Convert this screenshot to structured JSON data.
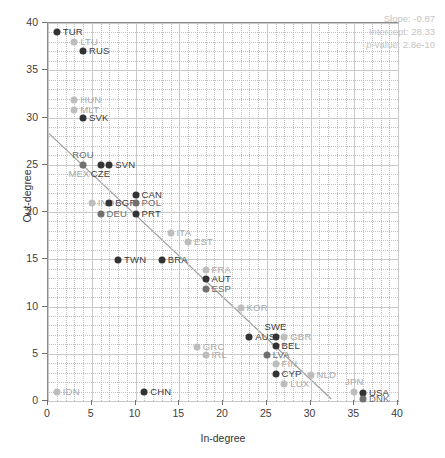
{
  "chart_data": {
    "type": "scatter",
    "title": "",
    "xlabel": "In-degree",
    "ylabel": "Out-degree",
    "xlim": [
      0,
      40
    ],
    "ylim": [
      0,
      40
    ],
    "xticks": [
      0,
      5,
      10,
      15,
      20,
      25,
      30,
      35,
      40
    ],
    "yticks": [
      0,
      5,
      10,
      15,
      20,
      25,
      30,
      35,
      40
    ],
    "grid": true,
    "legend": "none",
    "points": [
      {
        "label": "TUR",
        "x": 1,
        "y": 39,
        "shade": "dark",
        "pos": "right"
      },
      {
        "label": "LTU",
        "x": 3,
        "y": 38,
        "shade": "light",
        "pos": "right"
      },
      {
        "label": "RUS",
        "x": 4,
        "y": 37,
        "shade": "dark",
        "pos": "right"
      },
      {
        "label": "HUN",
        "x": 3,
        "y": 31.9,
        "shade": "light",
        "pos": "right"
      },
      {
        "label": "MLT",
        "x": 3,
        "y": 30.8,
        "shade": "light",
        "pos": "right"
      },
      {
        "label": "SVK",
        "x": 4,
        "y": 29.9,
        "shade": "dark",
        "pos": "right"
      },
      {
        "label": "MEX",
        "x": 4,
        "y": 25,
        "shade": "light",
        "pos": "below-left"
      },
      {
        "label": "ROU",
        "x": 4,
        "y": 25,
        "shade": "mid",
        "pos": "above"
      },
      {
        "label": "CZE",
        "x": 6,
        "y": 25,
        "shade": "dark",
        "pos": "below"
      },
      {
        "label": "SVN",
        "x": 7,
        "y": 25,
        "shade": "dark",
        "pos": "right"
      },
      {
        "label": "CAN",
        "x": 10,
        "y": 21.8,
        "shade": "dark",
        "pos": "right"
      },
      {
        "label": "IND",
        "x": 5,
        "y": 20.9,
        "shade": "light",
        "pos": "right"
      },
      {
        "label": "BGR",
        "x": 7,
        "y": 20.9,
        "shade": "dark",
        "pos": "right"
      },
      {
        "label": "POL",
        "x": 10,
        "y": 20.9,
        "shade": "mid",
        "pos": "right"
      },
      {
        "label": "DEU",
        "x": 6,
        "y": 19.8,
        "shade": "mid",
        "pos": "right"
      },
      {
        "label": "PRT",
        "x": 10,
        "y": 19.8,
        "shade": "dark",
        "pos": "right"
      },
      {
        "label": "ITA",
        "x": 14,
        "y": 17.8,
        "shade": "light",
        "pos": "right"
      },
      {
        "label": "EST",
        "x": 16,
        "y": 16.8,
        "shade": "light",
        "pos": "right"
      },
      {
        "label": "TWN",
        "x": 8,
        "y": 14.9,
        "shade": "dark",
        "pos": "right"
      },
      {
        "label": "BRA",
        "x": 13,
        "y": 14.9,
        "shade": "dark",
        "pos": "right"
      },
      {
        "label": "FRA",
        "x": 18,
        "y": 13.9,
        "shade": "light",
        "pos": "right"
      },
      {
        "label": "AUT",
        "x": 18,
        "y": 12.9,
        "shade": "dark",
        "pos": "right"
      },
      {
        "label": "ESP",
        "x": 18,
        "y": 11.8,
        "shade": "mid",
        "pos": "right"
      },
      {
        "label": "KOR",
        "x": 22,
        "y": 9.8,
        "shade": "light",
        "pos": "right"
      },
      {
        "label": "SWE",
        "x": 26,
        "y": 6.8,
        "shade": "dark",
        "pos": "above"
      },
      {
        "label": "AUS",
        "x": 23,
        "y": 6.8,
        "shade": "dark",
        "pos": "right"
      },
      {
        "label": "GBR",
        "x": 27,
        "y": 6.8,
        "shade": "light",
        "pos": "right"
      },
      {
        "label": "BEL",
        "x": 26,
        "y": 5.8,
        "shade": "dark",
        "pos": "right"
      },
      {
        "label": "GRC",
        "x": 17,
        "y": 5.7,
        "shade": "light",
        "pos": "right"
      },
      {
        "label": "IRL",
        "x": 18,
        "y": 4.9,
        "shade": "light",
        "pos": "right"
      },
      {
        "label": "LVA",
        "x": 25,
        "y": 4.9,
        "shade": "mid",
        "pos": "right"
      },
      {
        "label": "FIN",
        "x": 26,
        "y": 3.9,
        "shade": "light",
        "pos": "right"
      },
      {
        "label": "CYP",
        "x": 26,
        "y": 2.9,
        "shade": "dark",
        "pos": "right"
      },
      {
        "label": "NLD",
        "x": 30,
        "y": 2.7,
        "shade": "light",
        "pos": "right"
      },
      {
        "label": "LUX",
        "x": 27,
        "y": 1.8,
        "shade": "light",
        "pos": "right"
      },
      {
        "label": "IDN",
        "x": 1,
        "y": 0.9,
        "shade": "light",
        "pos": "right"
      },
      {
        "label": "CHN",
        "x": 11,
        "y": 0.9,
        "shade": "dark",
        "pos": "right"
      },
      {
        "label": "JPN",
        "x": 35,
        "y": 0.9,
        "shade": "light",
        "pos": "above"
      },
      {
        "label": "USA",
        "x": 36,
        "y": 0.8,
        "shade": "dark",
        "pos": "right"
      },
      {
        "label": "DNK",
        "x": 36,
        "y": 0.2,
        "shade": "mid",
        "pos": "right"
      }
    ],
    "fit_line": {
      "slope": -0.87,
      "intercept": 28.33,
      "x_start": 0,
      "x_end": 32.56,
      "color": "#9a9a9a"
    },
    "annotation": {
      "slope_text": "Slope: -0.87",
      "intercept_text": "Intercept: 28.33",
      "pvalue_prefix": "p",
      "pvalue_text": "-value: 2.8e-10",
      "color": "#c4c4c4"
    }
  }
}
